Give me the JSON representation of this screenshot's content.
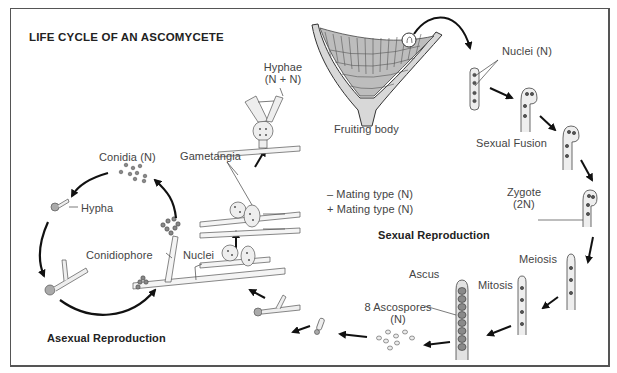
{
  "title": "LIFE CYCLE OF AN ASCOMYCETE",
  "sections": {
    "asexual": "Asexual Reproduction",
    "sexual": "Sexual Reproduction"
  },
  "labels": {
    "hyphae": "Hyphae",
    "hyphae_ploidy": "(N + N)",
    "fruiting_body": "Fruiting body",
    "nuclei_n": "Nuclei (N)",
    "sexual_fusion": "Sexual Fusion",
    "zygote": "Zygote",
    "zygote_ploidy": "(2N)",
    "meiosis": "Meiosis",
    "mitosis": "Mitosis",
    "ascus": "Ascus",
    "ascospores": "8 Ascospores",
    "ascospores_ploidy": "(N)",
    "gametangia": "Gametangia",
    "mating_minus": "–  Mating type (N)",
    "mating_plus": "+  Mating type (N)",
    "conidia": "Conidia (N)",
    "hypha": "Hypha",
    "conidiophore": "Conidiophore",
    "nuclei": "Nuclei"
  },
  "colors": {
    "line": "#222222",
    "text": "#444444",
    "fill_light": "#e6e6e6",
    "fill_dark": "#8a8a8a"
  }
}
